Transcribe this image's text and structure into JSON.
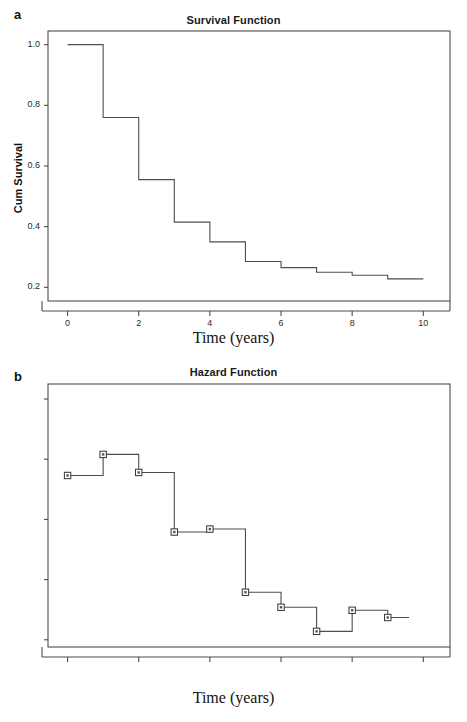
{
  "figure": {
    "panels": [
      {
        "letter": "a",
        "title": "Survival Function"
      },
      {
        "letter": "b",
        "title": "Hazard Function"
      }
    ]
  },
  "chart_data": [
    {
      "type": "line",
      "subtype": "step",
      "panel_letter": "a",
      "title": "Survival Function",
      "xlabel": "Time (years)",
      "ylabel": "Cum Survival",
      "xlim": [
        -0.55,
        10.75
      ],
      "ylim": [
        0.155,
        1.045
      ],
      "xticks": [
        0,
        2,
        4,
        6,
        8,
        10
      ],
      "xtick_labels": [
        "0",
        "2",
        "4",
        "6",
        "8",
        "10"
      ],
      "yticks": [
        0.2,
        0.4,
        0.6,
        0.8,
        1.0
      ],
      "ytick_labels": [
        "0.2",
        "0.4",
        "0.6",
        "0.8",
        "1.0"
      ],
      "grid": false,
      "legend": "none",
      "markers": false,
      "line_color": "#4d4d4d",
      "x": [
        0,
        1,
        2,
        3,
        4,
        5,
        6,
        7,
        8,
        9,
        10
      ],
      "y": [
        1.0,
        0.76,
        0.555,
        0.415,
        0.35,
        0.285,
        0.265,
        0.25,
        0.24,
        0.228,
        0.228
      ],
      "steps": [
        {
          "from": 0,
          "to": 1,
          "value": 1.0
        },
        {
          "from": 1,
          "to": 2,
          "value": 0.76
        },
        {
          "from": 2,
          "to": 3,
          "value": 0.555
        },
        {
          "from": 3,
          "to": 4,
          "value": 0.415
        },
        {
          "from": 4,
          "to": 5,
          "value": 0.35
        },
        {
          "from": 5,
          "to": 6,
          "value": 0.285
        },
        {
          "from": 6,
          "to": 7,
          "value": 0.265
        },
        {
          "from": 7,
          "to": 8,
          "value": 0.25
        },
        {
          "from": 8,
          "to": 9,
          "value": 0.24
        },
        {
          "from": 9,
          "to": 10,
          "value": 0.228
        }
      ]
    },
    {
      "type": "line",
      "subtype": "step",
      "panel_letter": "b",
      "title": "Hazard Function",
      "xlabel": "Time (years)",
      "ylabel": "Hazard",
      "xlim": [
        -0.55,
        10.75
      ],
      "ylim": [
        -0.012,
        0.425
      ],
      "xticks": [
        0,
        2,
        4,
        6,
        8,
        10
      ],
      "xtick_labels": [
        "0",
        "2",
        "4",
        "6",
        "8",
        "10"
      ],
      "yticks": [
        0.0,
        0.1,
        0.2,
        0.3,
        0.4
      ],
      "ytick_labels": [
        "0.0",
        "0.1",
        "0.2",
        "0.3",
        "0.4"
      ],
      "grid": false,
      "legend": "none",
      "markers": true,
      "marker_shape": "open-square",
      "line_color": "#4d4d4d",
      "x": [
        0,
        1,
        2,
        3,
        4,
        5,
        6,
        7,
        8,
        9
      ],
      "y": [
        0.273,
        0.308,
        0.278,
        0.179,
        0.184,
        0.079,
        0.054,
        0.014,
        0.049,
        0.037
      ],
      "steps": [
        {
          "from": 0,
          "to": 1,
          "value": 0.273
        },
        {
          "from": 1,
          "to": 2,
          "value": 0.308
        },
        {
          "from": 2,
          "to": 3,
          "value": 0.278
        },
        {
          "from": 3,
          "to": 4,
          "value": 0.179
        },
        {
          "from": 4,
          "to": 5,
          "value": 0.184
        },
        {
          "from": 5,
          "to": 6,
          "value": 0.079
        },
        {
          "from": 6,
          "to": 7,
          "value": 0.054
        },
        {
          "from": 7,
          "to": 8,
          "value": 0.014
        },
        {
          "from": 8,
          "to": 9,
          "value": 0.049
        },
        {
          "from": 9,
          "to": 9.6,
          "value": 0.037
        }
      ]
    }
  ]
}
